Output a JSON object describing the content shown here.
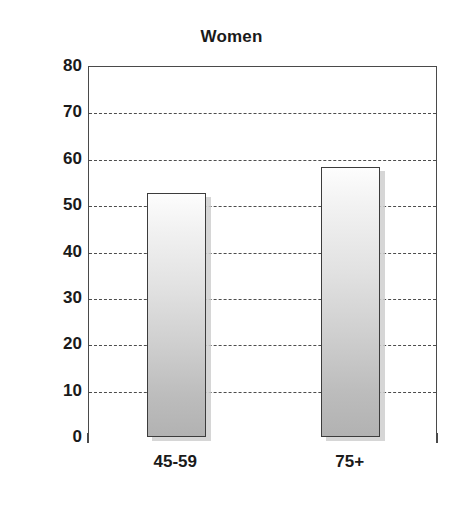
{
  "chart_data": {
    "type": "bar",
    "title": "Women",
    "xlabel": "",
    "ylabel": "",
    "categories": [
      "45-59",
      "75+"
    ],
    "values": [
      52.6,
      58.3
    ],
    "series": [
      {
        "name": "Women",
        "values": [
          52.6,
          58.3
        ]
      }
    ],
    "ylim": [
      0,
      80
    ],
    "ytick_values": [
      0,
      10,
      20,
      30,
      40,
      50,
      60,
      70,
      80
    ],
    "ytick_labels": [
      "0",
      "10",
      "20",
      "30",
      "40",
      "50",
      "60",
      "70",
      "80"
    ],
    "gridlines": {
      "horizontal": true,
      "vertical": false,
      "style": "dashed",
      "at": [
        10,
        20,
        30,
        40,
        50,
        60,
        70
      ]
    },
    "legend": {
      "visible": false,
      "position": "none"
    },
    "colors": {
      "bar_fill_top": "#fdfdfd",
      "bar_fill_bottom": "#b2b2b2",
      "bar_border": "#3c3c3c",
      "bar_shadow": "#cfcfcf",
      "gridline": "#4d4d4d",
      "axis": "#4a4a4a",
      "text": "#1a1a1a",
      "background": "#ffffff"
    }
  }
}
